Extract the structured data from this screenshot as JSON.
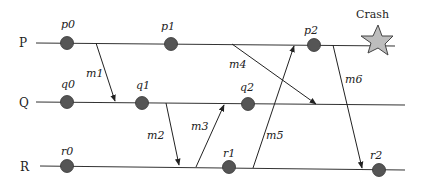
{
  "diagram": {
    "type": "space-time message diagram",
    "colors": {
      "line": "#333333",
      "event": "#555555",
      "star_fill": "#bdbdbd",
      "star_stroke": "#444444"
    },
    "processes": [
      {
        "id": "P",
        "label": "P",
        "y": 43,
        "x1": 36,
        "x2": 395
      },
      {
        "id": "Q",
        "label": "Q",
        "y": 103,
        "x1": 36,
        "x2": 405
      },
      {
        "id": "R",
        "label": "R",
        "y": 167,
        "x1": 40,
        "x2": 405
      }
    ],
    "events": [
      {
        "label": "p0",
        "process": "P",
        "x": 67,
        "y": 43
      },
      {
        "label": "p1",
        "process": "P",
        "x": 171,
        "y": 44
      },
      {
        "label": "p2",
        "process": "P",
        "x": 314,
        "y": 45
      },
      {
        "label": "q0",
        "process": "Q",
        "x": 67,
        "y": 102
      },
      {
        "label": "q1",
        "process": "Q",
        "x": 142,
        "y": 103
      },
      {
        "label": "q2",
        "process": "Q",
        "x": 248,
        "y": 104
      },
      {
        "label": "r0",
        "process": "R",
        "x": 67,
        "y": 166
      },
      {
        "label": "r1",
        "process": "R",
        "x": 229,
        "y": 167
      },
      {
        "label": "r2",
        "process": "R",
        "x": 379,
        "y": 170
      }
    ],
    "messages": [
      {
        "label": "m1",
        "from": "P",
        "to": "Q"
      },
      {
        "label": "m2",
        "from": "Q",
        "to": "R"
      },
      {
        "label": "m3",
        "from": "R",
        "to": "Q"
      },
      {
        "label": "m4",
        "from": "P",
        "to": "Q"
      },
      {
        "label": "m5",
        "from": "R",
        "to": "P"
      },
      {
        "label": "m6",
        "from": "P",
        "to": "R"
      }
    ],
    "crash": {
      "label": "Crash",
      "process": "P"
    }
  }
}
